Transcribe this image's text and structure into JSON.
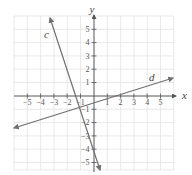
{
  "graph": {
    "x_axis_label": "x",
    "y_axis_label": "y",
    "x_ticks": [
      "−5",
      "−4",
      "−3",
      "−2",
      "−1",
      "1",
      "2",
      "3",
      "4",
      "5"
    ],
    "y_ticks": [
      "5",
      "4",
      "3",
      "2",
      "1",
      "−1",
      "−2",
      "−3",
      "−4",
      "−5"
    ],
    "lines": [
      {
        "label": "c",
        "equation": "y = -3x - 4",
        "color": "#707070"
      },
      {
        "label": "d",
        "equation": "y = x/3 - 2/3",
        "color": "#707070"
      }
    ],
    "grid_color": "#e3e3e3",
    "axis_color": "#555555"
  }
}
